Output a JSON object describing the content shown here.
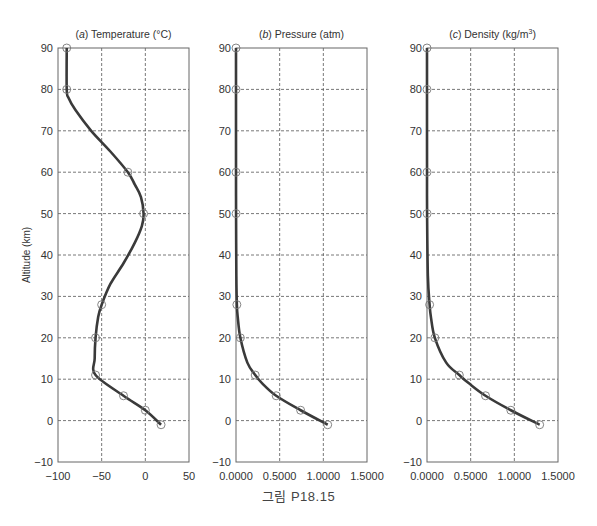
{
  "figure": {
    "caption": "그림 P18.15",
    "ylabel": "Altitude (km)",
    "ylim": [
      -10,
      90
    ],
    "yticks": [
      -10,
      0,
      10,
      20,
      30,
      40,
      50,
      60,
      70,
      80,
      90
    ],
    "colors": {
      "line": "#3a3a3a",
      "grid": "#555555",
      "frame": "#666666",
      "marker": "#777777",
      "text": "#333333"
    }
  },
  "chart_data": [
    {
      "type": "line",
      "id": "a",
      "title_prefix": "(a)",
      "title": "Temperature (°C)",
      "xlabel": "",
      "ylabel": "Altitude (km)",
      "xlim": [
        -100,
        50
      ],
      "ylim": [
        -10,
        90
      ],
      "xticks": [
        -100,
        -50,
        0,
        50
      ],
      "xtick_labels": [
        "−100",
        "−50",
        "0",
        "50"
      ],
      "grid": true,
      "markers": [
        {
          "x": 18,
          "y": -1
        },
        {
          "x": 0,
          "y": 2.5
        },
        {
          "x": -25,
          "y": 6
        },
        {
          "x": -57,
          "y": 11
        },
        {
          "x": -57,
          "y": 20
        },
        {
          "x": -50,
          "y": 28
        },
        {
          "x": -2,
          "y": 50
        },
        {
          "x": -20,
          "y": 60
        },
        {
          "x": -90,
          "y": 80
        },
        {
          "x": -90,
          "y": 90
        }
      ],
      "curve": [
        [
          18,
          -1
        ],
        [
          0,
          2.5
        ],
        [
          -25,
          6
        ],
        [
          -57,
          11
        ],
        [
          -58,
          15
        ],
        [
          -57,
          20
        ],
        [
          -54,
          25
        ],
        [
          -50,
          28
        ],
        [
          -40,
          33
        ],
        [
          -25,
          38
        ],
        [
          -12,
          43
        ],
        [
          -4,
          47
        ],
        [
          -2,
          50
        ],
        [
          -5,
          54
        ],
        [
          -12,
          57
        ],
        [
          -20,
          60
        ],
        [
          -40,
          65
        ],
        [
          -62,
          70
        ],
        [
          -80,
          75
        ],
        [
          -88,
          78
        ],
        [
          -90,
          80
        ],
        [
          -90,
          90
        ]
      ]
    },
    {
      "type": "line",
      "id": "b",
      "title_prefix": "(b)",
      "title": "Pressure (atm)",
      "xlabel": "",
      "ylabel": "Altitude (km)",
      "xlim": [
        0,
        1.5
      ],
      "ylim": [
        -10,
        90
      ],
      "xticks": [
        0,
        0.5,
        1.0,
        1.5
      ],
      "xtick_labels": [
        "0.0000",
        "0.5000",
        "1.0000",
        "1.5000"
      ],
      "grid": true,
      "markers": [
        {
          "x": 1.05,
          "y": -1
        },
        {
          "x": 0.74,
          "y": 2.5
        },
        {
          "x": 0.46,
          "y": 6
        },
        {
          "x": 0.22,
          "y": 11
        },
        {
          "x": 0.05,
          "y": 20
        },
        {
          "x": 0.01,
          "y": 28
        },
        {
          "x": 0.0008,
          "y": 50
        },
        {
          "x": 0.0002,
          "y": 60
        },
        {
          "x": 1e-05,
          "y": 80
        },
        {
          "x": 2e-06,
          "y": 90
        }
      ],
      "curve": [
        [
          1.05,
          -1
        ],
        [
          0.74,
          2.5
        ],
        [
          0.46,
          6
        ],
        [
          0.3,
          9
        ],
        [
          0.22,
          11
        ],
        [
          0.13,
          14
        ],
        [
          0.05,
          20
        ],
        [
          0.02,
          25
        ],
        [
          0.01,
          28
        ],
        [
          0.004,
          35
        ],
        [
          0.0008,
          50
        ],
        [
          0.0002,
          60
        ],
        [
          1e-05,
          80
        ],
        [
          2e-06,
          90
        ]
      ]
    },
    {
      "type": "line",
      "id": "c",
      "title_prefix": "(c)",
      "title": "Density (kg/m",
      "title_sup": "3",
      "title_suffix": ")",
      "xlabel": "",
      "ylabel": "Altitude (km)",
      "xlim": [
        0,
        1.5
      ],
      "ylim": [
        -10,
        90
      ],
      "xticks": [
        0,
        0.5,
        1.0,
        1.5
      ],
      "xtick_labels": [
        "0.0000",
        "0.5000",
        "1.0000",
        "1.5000"
      ],
      "grid": true,
      "markers": [
        {
          "x": 1.29,
          "y": -1
        },
        {
          "x": 0.96,
          "y": 2.5
        },
        {
          "x": 0.67,
          "y": 6
        },
        {
          "x": 0.37,
          "y": 11
        },
        {
          "x": 0.09,
          "y": 20
        },
        {
          "x": 0.03,
          "y": 28
        },
        {
          "x": 0.001,
          "y": 50
        },
        {
          "x": 0.0003,
          "y": 60
        },
        {
          "x": 2e-05,
          "y": 80
        },
        {
          "x": 3e-06,
          "y": 90
        }
      ],
      "curve": [
        [
          1.29,
          -1
        ],
        [
          0.96,
          2.5
        ],
        [
          0.67,
          6
        ],
        [
          0.48,
          9
        ],
        [
          0.37,
          11
        ],
        [
          0.22,
          14
        ],
        [
          0.09,
          20
        ],
        [
          0.045,
          25
        ],
        [
          0.03,
          28
        ],
        [
          0.01,
          35
        ],
        [
          0.001,
          50
        ],
        [
          0.0003,
          60
        ],
        [
          2e-05,
          80
        ],
        [
          3e-06,
          90
        ]
      ]
    }
  ]
}
